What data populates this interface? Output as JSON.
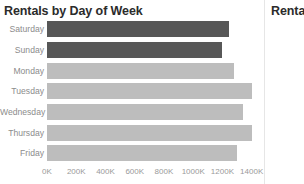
{
  "panels": {
    "primary": {
      "title": "Rentals by Day of Week"
    },
    "secondary": {
      "title": "Rentals by Day of Week"
    }
  },
  "colors": {
    "bar_default": "#bdbdbd",
    "bar_highlight": "#575757",
    "title_text": "#2b2b2b",
    "label_text": "#8c8c8c",
    "axis_text": "#9a9a9a",
    "panel_divider": "#e6e6e6",
    "background": "#ffffff"
  },
  "chart_data": {
    "type": "bar",
    "orientation": "horizontal",
    "title": "Rentals by Day of Week",
    "xlabel": "",
    "ylabel": "",
    "categories": [
      "Saturday",
      "Sunday",
      "Monday",
      "Tuesday",
      "Wednesday",
      "Thursday",
      "Friday"
    ],
    "values": [
      1245000,
      1200000,
      1280000,
      1400000,
      1340000,
      1405000,
      1300000
    ],
    "highlighted": [
      "Saturday",
      "Sunday"
    ],
    "xlim": [
      0,
      1450000
    ],
    "grid": false,
    "legend": "none",
    "axis_ticks": [
      {
        "value": 0,
        "label": "0K"
      },
      {
        "value": 200000,
        "label": "200K"
      },
      {
        "value": 400000,
        "label": "400K"
      },
      {
        "value": 600000,
        "label": "600K"
      },
      {
        "value": 800000,
        "label": "800K"
      },
      {
        "value": 1000000,
        "label": "1000K"
      },
      {
        "value": 1200000,
        "label": "1200K"
      },
      {
        "value": 1400000,
        "label": "1400K"
      }
    ]
  }
}
